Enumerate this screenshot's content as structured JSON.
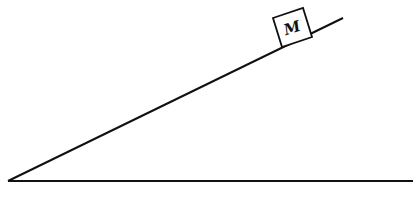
{
  "diagram": {
    "block": {
      "label": "M"
    },
    "colors": {
      "line": "#111111",
      "background": "#ffffff"
    }
  }
}
